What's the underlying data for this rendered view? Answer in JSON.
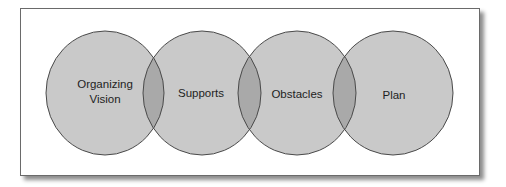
{
  "diagram": {
    "type": "overlapping-circles",
    "colors": {
      "background": "#ffffff",
      "frame_border": "#6a6a6a",
      "circle_fill": "#c9c9c9",
      "overlap_fill": "#a9a9a9",
      "circle_stroke": "#4a4a4a",
      "text": "#1e1e1e"
    },
    "circles": [
      {
        "id": "organizing-vision",
        "label_line1": "Organizing",
        "label_line2": "Vision",
        "cx": 105,
        "cy": 93,
        "rx": 59,
        "ry": 62
      },
      {
        "id": "supports",
        "label": "Supports",
        "cx": 202,
        "cy": 93,
        "rx": 59,
        "ry": 62
      },
      {
        "id": "obstacles",
        "label": "Obstacles",
        "cx": 297,
        "cy": 93,
        "rx": 59,
        "ry": 62
      },
      {
        "id": "plan",
        "label": "Plan",
        "cx": 393,
        "cy": 93,
        "rx": 60,
        "ry": 62
      }
    ]
  }
}
